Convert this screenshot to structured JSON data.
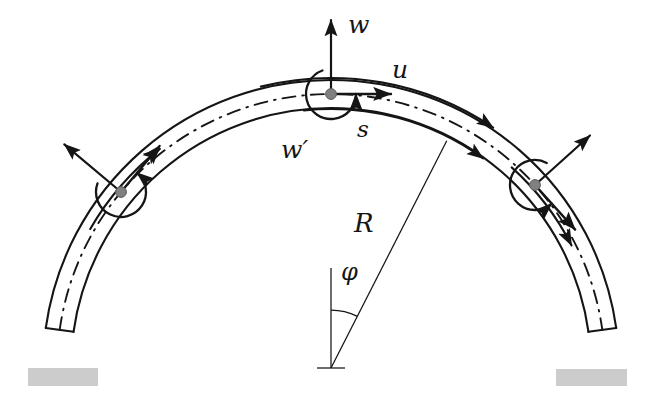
{
  "figure": {
    "domain": "diagram",
    "kind": "engineering-mechanics-schematic",
    "background_color": "#ffffff",
    "line_color": "#151515",
    "node_color": "#808080",
    "support_color": "#cccccc",
    "centerline_style": "dash-dot"
  },
  "labels": {
    "w": "w",
    "u": "u",
    "s": "s",
    "w_prime": "w′",
    "R": "R",
    "phi": "φ"
  },
  "geometry": {
    "center": {
      "x": 331,
      "y": 368
    },
    "radius_outer": 288,
    "radius_centerline": 274,
    "radius_inner": 260,
    "arch_span_degrees_start": 8,
    "arch_span_degrees_end": 172,
    "phi_angle_degrees": 26,
    "radius_line_angle_degrees": 63
  },
  "nodes": [
    {
      "name": "left-node",
      "angle_deg": 140,
      "x": 121,
      "y": 192
    },
    {
      "name": "apex-node",
      "angle_deg": 90,
      "x": 331,
      "y": 94
    },
    {
      "name": "right-node",
      "angle_deg": 42,
      "x": 535,
      "y": 185
    }
  ],
  "supports": [
    {
      "name": "left-support",
      "x": 28,
      "y": 368,
      "width": 70,
      "height": 18
    },
    {
      "name": "right-support",
      "x": 556,
      "y": 369,
      "width": 71,
      "height": 17
    }
  ],
  "dof_arrows": [
    {
      "node": "left-node",
      "type": "radial-displacement",
      "symbol": "w"
    },
    {
      "node": "left-node",
      "type": "tangential-displacement",
      "symbol": "u"
    },
    {
      "node": "left-node",
      "type": "rotation",
      "symbol": "w′"
    },
    {
      "node": "apex-node",
      "type": "radial-displacement",
      "symbol": "w"
    },
    {
      "node": "apex-node",
      "type": "tangential-displacement",
      "symbol": "u"
    },
    {
      "node": "apex-node",
      "type": "rotation",
      "symbol": "w′"
    },
    {
      "node": "right-node",
      "type": "radial-displacement",
      "symbol": "w"
    },
    {
      "node": "right-node",
      "type": "tangential-displacement",
      "symbol": "u"
    },
    {
      "node": "right-node",
      "type": "rotation",
      "symbol": "w′"
    }
  ],
  "label_positions": {
    "w": {
      "x": 348,
      "y": 12
    },
    "u": {
      "x": 392,
      "y": 57
    },
    "s": {
      "x": 357,
      "y": 118
    },
    "w_prime": {
      "x": 281,
      "y": 137
    },
    "R": {
      "x": 354,
      "y": 210
    },
    "phi": {
      "x": 341,
      "y": 260
    }
  }
}
